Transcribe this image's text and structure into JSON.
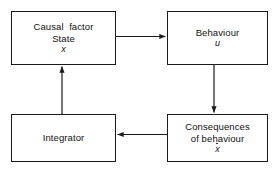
{
  "diagram": {
    "type": "block-flow-diagram",
    "background_color": "#ffffff",
    "stroke_color": "#1a1a1a",
    "text_color": "#111111",
    "nodes": [
      {
        "id": "causal-factor",
        "line1": "Causal  factor",
        "line2": "State",
        "symbol": "x",
        "symbol_style": "italic",
        "symbol_overdot": false
      },
      {
        "id": "behaviour",
        "line1": "Behaviour",
        "line2": "",
        "symbol": "u",
        "symbol_style": "italic",
        "symbol_overdot": false
      },
      {
        "id": "consequences",
        "line1": "Consequences",
        "line2": "of behaviour",
        "symbol": "x",
        "symbol_style": "italic",
        "symbol_overdot": true
      },
      {
        "id": "integrator",
        "line1": "Integrator",
        "line2": "",
        "symbol": "",
        "symbol_style": "normal",
        "symbol_overdot": false
      }
    ],
    "edges": [
      {
        "id": "causal-to-behaviour",
        "from": "causal-factor",
        "to": "behaviour",
        "direction": "right",
        "label": ""
      },
      {
        "id": "behaviour-to-consequences",
        "from": "behaviour",
        "to": "consequences",
        "direction": "down",
        "label": ""
      },
      {
        "id": "consequences-to-integrator",
        "from": "consequences",
        "to": "integrator",
        "direction": "left",
        "label": ""
      },
      {
        "id": "integrator-to-causal",
        "from": "integrator",
        "to": "causal-factor",
        "direction": "up",
        "label": ""
      }
    ]
  }
}
